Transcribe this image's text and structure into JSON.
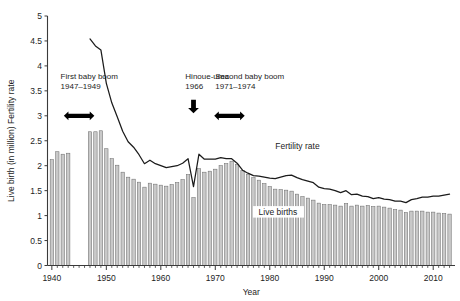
{
  "chart": {
    "type": "combo",
    "axes": {
      "x": {
        "label": "Year",
        "min": 1939.2,
        "max": 2014.0,
        "major_ticks": [
          1940,
          1950,
          1960,
          1970,
          1980,
          1990,
          2000,
          2010
        ],
        "tick_labels": [
          "1940",
          "1950",
          "1960",
          "1970",
          "1980",
          "1990",
          "2000",
          "2010"
        ]
      },
      "y": {
        "label": "Live birth (in million) Fertility rate",
        "min": 0,
        "max": 5,
        "ticks": [
          0,
          0.5,
          1,
          1.5,
          2,
          2.5,
          3,
          3.5,
          4,
          4.5,
          5
        ],
        "tick_labels": [
          "0",
          "0.5",
          "1",
          "1.5",
          "2",
          "2.5",
          "3",
          "3.5",
          "4",
          "4.5",
          "5"
        ]
      }
    },
    "series_labels": {
      "bars": "Live births",
      "line": "Fertility rate"
    },
    "annotations": [
      {
        "id": "first-baby-boom",
        "title": "First baby boom",
        "years": "1947–1949",
        "text_x": 1941.6,
        "text_y": 3.74,
        "marker": "double-arrow",
        "marker_x": 1945.0,
        "marker_y": 3.0,
        "marker_width": 5.6
      },
      {
        "id": "hinoue-uma",
        "title": "Hinoue-uma",
        "years": "1966",
        "text_x": 1964.5,
        "text_y": 3.74,
        "marker": "down-arrow",
        "marker_x": 1966.0,
        "marker_y": 3.05
      },
      {
        "id": "second-baby-boom",
        "title": "Second baby boom",
        "years": "1971–1974",
        "text_x": 1970.0,
        "text_y": 3.74,
        "marker": "double-arrow",
        "marker_x": 1972.6,
        "marker_y": 3.0,
        "marker_width": 5.6
      }
    ],
    "bar_label_pos": {
      "x": 1981.5,
      "y": 1.02
    },
    "line_label_pos": {
      "x": 1981.0,
      "y": 2.33
    }
  },
  "chart_data": {
    "type": "bar",
    "title": "",
    "xlabel": "Year",
    "ylabel": "Live birth (in million) Fertility rate",
    "xlim": [
      1939.2,
      2014.0
    ],
    "ylim": [
      0,
      5
    ],
    "grid": false,
    "legend": "inline-labels",
    "series": [
      {
        "name": "Live births",
        "unit": "million",
        "render": "bar",
        "x": [
          1940,
          1941,
          1942,
          1943,
          1947,
          1948,
          1949,
          1950,
          1951,
          1952,
          1953,
          1954,
          1955,
          1956,
          1957,
          1958,
          1959,
          1960,
          1961,
          1962,
          1963,
          1964,
          1965,
          1966,
          1967,
          1968,
          1969,
          1970,
          1971,
          1972,
          1973,
          1974,
          1975,
          1976,
          1977,
          1978,
          1979,
          1980,
          1981,
          1982,
          1983,
          1984,
          1985,
          1986,
          1987,
          1988,
          1989,
          1990,
          1991,
          1992,
          1993,
          1994,
          1995,
          1996,
          1997,
          1998,
          1999,
          2000,
          2001,
          2002,
          2003,
          2004,
          2005,
          2006,
          2007,
          2008,
          2009,
          2010,
          2011,
          2012,
          2013
        ],
        "values": [
          2.12,
          2.28,
          2.23,
          2.25,
          2.68,
          2.68,
          2.7,
          2.34,
          2.14,
          2.01,
          1.87,
          1.77,
          1.73,
          1.67,
          1.57,
          1.65,
          1.63,
          1.61,
          1.59,
          1.62,
          1.66,
          1.72,
          1.82,
          1.36,
          1.94,
          1.87,
          1.89,
          1.93,
          2.0,
          2.04,
          2.09,
          2.03,
          1.9,
          1.83,
          1.76,
          1.71,
          1.64,
          1.58,
          1.53,
          1.52,
          1.51,
          1.49,
          1.43,
          1.38,
          1.35,
          1.31,
          1.25,
          1.22,
          1.22,
          1.21,
          1.19,
          1.24,
          1.19,
          1.21,
          1.19,
          1.2,
          1.18,
          1.19,
          1.17,
          1.15,
          1.12,
          1.11,
          1.06,
          1.09,
          1.09,
          1.09,
          1.07,
          1.07,
          1.05,
          1.04,
          1.03
        ]
      },
      {
        "name": "Fertility rate",
        "unit": "births per woman",
        "render": "line",
        "x": [
          1947,
          1948,
          1949,
          1950,
          1951,
          1952,
          1953,
          1954,
          1955,
          1956,
          1957,
          1958,
          1959,
          1960,
          1961,
          1962,
          1963,
          1964,
          1965,
          1966,
          1967,
          1968,
          1969,
          1970,
          1971,
          1972,
          1973,
          1974,
          1975,
          1976,
          1977,
          1978,
          1979,
          1980,
          1981,
          1982,
          1983,
          1984,
          1985,
          1986,
          1987,
          1988,
          1989,
          1990,
          1991,
          1992,
          1993,
          1994,
          1995,
          1996,
          1997,
          1998,
          1999,
          2000,
          2001,
          2002,
          2003,
          2004,
          2005,
          2006,
          2007,
          2008,
          2009,
          2010,
          2011,
          2012,
          2013
        ],
        "values": [
          4.54,
          4.4,
          4.32,
          3.65,
          3.26,
          2.98,
          2.69,
          2.48,
          2.37,
          2.22,
          2.04,
          2.11,
          2.04,
          2.0,
          1.96,
          1.98,
          2.0,
          2.05,
          2.14,
          1.58,
          2.23,
          2.13,
          2.13,
          2.13,
          2.16,
          2.14,
          2.14,
          2.05,
          1.91,
          1.85,
          1.8,
          1.79,
          1.77,
          1.75,
          1.74,
          1.77,
          1.8,
          1.81,
          1.76,
          1.72,
          1.69,
          1.66,
          1.57,
          1.54,
          1.53,
          1.5,
          1.46,
          1.5,
          1.42,
          1.43,
          1.39,
          1.38,
          1.34,
          1.36,
          1.33,
          1.32,
          1.29,
          1.29,
          1.26,
          1.32,
          1.34,
          1.37,
          1.37,
          1.39,
          1.39,
          1.41,
          1.43
        ]
      }
    ],
    "annotations": [
      {
        "label": "First baby boom",
        "period": "1947–1949"
      },
      {
        "label": "Hinoue-uma",
        "period": "1966"
      },
      {
        "label": "Second baby boom",
        "period": "1971–1974"
      }
    ]
  }
}
